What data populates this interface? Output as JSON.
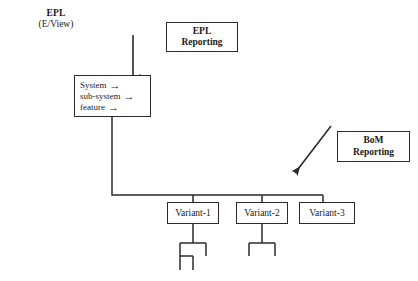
{
  "diagram": {
    "title_label": {
      "line1": "EPL",
      "line2": "(E/View)"
    },
    "callouts": [
      {
        "id": "epl-reporting",
        "line1": "EPL",
        "line2": "Reporting"
      },
      {
        "id": "bom-reporting",
        "line1": "BoM",
        "line2": "Reporting"
      }
    ],
    "structure_box": {
      "rows": [
        {
          "text": "System",
          "arrow": "→"
        },
        {
          "text": "sub-system",
          "arrow": "→"
        },
        {
          "text": "feature",
          "arrow": "→"
        }
      ]
    },
    "variants": [
      {
        "label": "Variant-1"
      },
      {
        "label": "Variant-2"
      },
      {
        "label": "Variant-3"
      }
    ],
    "arrows": [
      {
        "id": "epl-reporting-arrow",
        "direction": "down"
      },
      {
        "id": "bom-reporting-arrow",
        "direction": "down-left"
      }
    ],
    "colors": {
      "line": "#2b2b2b",
      "text": "#1a1a1a",
      "background": "#ffffff"
    }
  }
}
